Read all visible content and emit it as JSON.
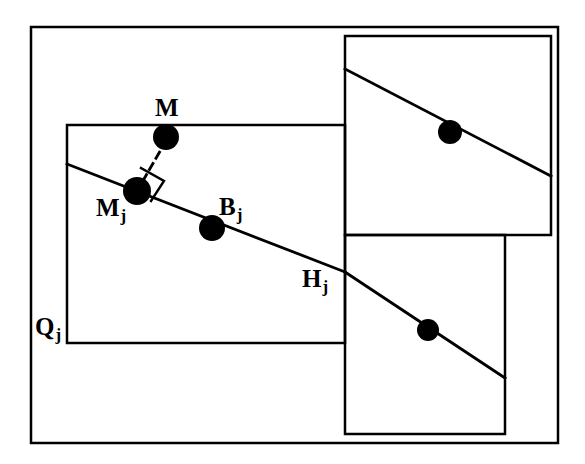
{
  "figure": {
    "background_color": "#ffffff",
    "stroke_color": "#000000",
    "dot_color": "#000000",
    "width": 585,
    "height": 464
  },
  "labels": {
    "m": {
      "text": "M",
      "sub": ""
    },
    "mj": {
      "text": "M",
      "sub": "j"
    },
    "bj": {
      "text": "B",
      "sub": "j"
    },
    "hj": {
      "text": "H",
      "sub": "j"
    },
    "qj": {
      "text": "Q",
      "sub": "j"
    }
  },
  "shapes": {
    "outer_frame": {
      "x": 31,
      "y": 27,
      "width": 527,
      "height": 416,
      "stroke_width": 2.5
    },
    "main_cell": {
      "x": 67,
      "y": 125,
      "width": 278,
      "height": 218,
      "stroke_width": 2.5
    },
    "upper_right_cell": {
      "x": 345,
      "y": 36,
      "width": 206,
      "height": 199,
      "stroke_width": 2.5
    },
    "lower_right_cell": {
      "x": 345,
      "y": 235,
      "width": 160,
      "height": 199,
      "stroke_width": 2.5
    }
  },
  "lines": {
    "main_line_segments": [
      {
        "name": "segment-main-cell",
        "x1": 67,
        "y1": 164,
        "x2": 345,
        "y2": 272
      },
      {
        "name": "segment-lower-right-cell",
        "x1": 345,
        "y1": 272,
        "x2": 505,
        "y2": 378
      }
    ],
    "upper_right_line": {
      "x1": 345,
      "y1": 69,
      "x2": 551,
      "y2": 176
    },
    "perpendicular_dashed": {
      "x1": 166,
      "y1": 141,
      "x2": 137,
      "y2": 191,
      "dash": "7 6"
    },
    "right_angle_marker": [
      {
        "x1": 141,
        "y1": 168,
        "x2": 164,
        "y2": 181
      },
      {
        "x1": 164,
        "y1": 181,
        "x2": 151,
        "y2": 201
      }
    ]
  },
  "points": [
    {
      "name": "point-M",
      "cx": 166,
      "cy": 137,
      "r": 13
    },
    {
      "name": "point-Mj",
      "cx": 137,
      "cy": 191,
      "r": 14
    },
    {
      "name": "point-Bj",
      "cx": 212,
      "cy": 228,
      "r": 13
    },
    {
      "name": "point-upper-right",
      "cx": 450,
      "cy": 132,
      "r": 12
    },
    {
      "name": "point-lower-right",
      "cx": 428,
      "cy": 330,
      "r": 11
    }
  ]
}
